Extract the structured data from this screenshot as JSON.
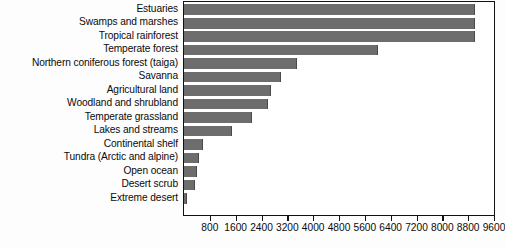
{
  "chart_data": {
    "type": "bar",
    "orientation": "horizontal",
    "title": "",
    "xlabel": "",
    "ylabel": "",
    "xlim": [
      0,
      9600
    ],
    "xticks": [
      800,
      1600,
      2400,
      3200,
      4000,
      4800,
      5600,
      6400,
      7200,
      8000,
      8800,
      9600
    ],
    "xtick_labels": [
      "800",
      "1600",
      "2400",
      "3200",
      "4000",
      "4800",
      "5600",
      "6400",
      "7200",
      "8000",
      "8800",
      "9600"
    ],
    "grid": false,
    "legend": null,
    "bar_color": "#6d6d6d",
    "categories": [
      "Estuaries",
      "Swamps and marshes",
      "Tropical rainforest",
      "Temperate forest",
      "Northern coniferous forest (taiga)",
      "Savanna",
      "Agricultural land",
      "Woodland and shrubland",
      "Temperate grassland",
      "Lakes and streams",
      "Continental shelf",
      "Tundra (Arctic and alpine)",
      "Open ocean",
      "Desert scrub",
      "Extreme desert"
    ],
    "values": [
      9000,
      9000,
      9000,
      6000,
      3500,
      3000,
      2700,
      2600,
      2100,
      1500,
      600,
      450,
      400,
      350,
      100
    ]
  }
}
